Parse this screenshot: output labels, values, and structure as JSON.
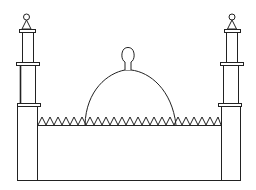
{
  "title": "Mosque line drawing",
  "colors": {
    "stroke": "#222222",
    "background": "#ffffff"
  },
  "figure": {
    "elements": [
      "left-minaret",
      "right-minaret",
      "dome",
      "dome-finial",
      "zigzag-parapet",
      "main-wall"
    ]
  }
}
